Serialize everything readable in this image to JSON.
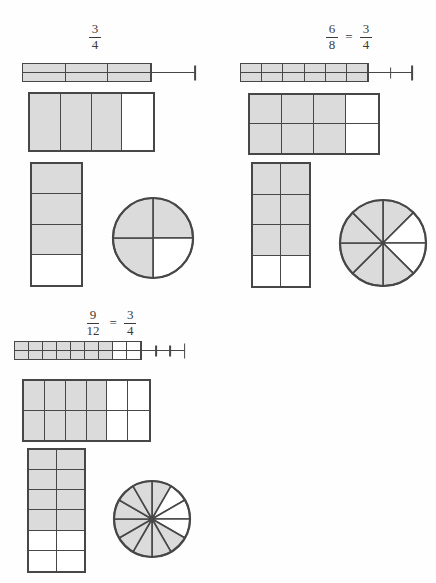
{
  "colors": {
    "shade": "#dbdbdb",
    "line": "#474747",
    "text": "#3a3a3a",
    "background": "#fefefe"
  },
  "chart_data": [
    {
      "type": "area",
      "title": "3/4",
      "representations": [
        "number-line bar",
        "horizontal grid",
        "vertical grid",
        "circle"
      ],
      "fraction_value": 0.75
    },
    {
      "type": "area",
      "title": "6/8 = 3/4",
      "representations": [
        "number-line bar",
        "horizontal grid",
        "vertical grid",
        "circle"
      ],
      "fraction_value": 0.75
    },
    {
      "type": "area",
      "title": "9/12 = 3/4",
      "representations": [
        "number-line bar",
        "horizontal grid",
        "vertical grid",
        "circle"
      ],
      "fraction_value": 0.75
    }
  ],
  "groups": [
    {
      "id": "three-fourths",
      "label": {
        "separator": "=",
        "fractions": [
          {
            "numerator": "3",
            "denominator": "4"
          }
        ]
      },
      "number_line": {
        "total_parts": 4,
        "boxed_parts": 3,
        "shaded_parts": 3,
        "tick_intervals": 1
      },
      "horizontal_grid": {
        "cols": 4,
        "rows": 1,
        "shaded_cols": 3,
        "shaded_cells": 3,
        "total_cells": 4
      },
      "vertical_grid": {
        "cols": 1,
        "rows": 4,
        "shaded_rows": 3,
        "shaded_cells": 3,
        "total_cells": 4
      },
      "circle": {
        "sectors": 4,
        "shaded_sectors": 3,
        "white_sector_indices": [
          1
        ]
      }
    },
    {
      "id": "six-eighths",
      "label": {
        "separator": "=",
        "fractions": [
          {
            "numerator": "6",
            "denominator": "8"
          },
          {
            "numerator": "3",
            "denominator": "4"
          }
        ]
      },
      "number_line": {
        "total_parts": 8,
        "boxed_parts": 6,
        "shaded_parts": 6,
        "tick_intervals": 2
      },
      "horizontal_grid": {
        "cols": 4,
        "rows": 2,
        "shaded_cols": 3,
        "shaded_cells": 6,
        "total_cells": 8
      },
      "vertical_grid": {
        "cols": 2,
        "rows": 4,
        "shaded_rows": 3,
        "shaded_cells": 6,
        "total_cells": 8
      },
      "circle": {
        "sectors": 8,
        "shaded_sectors": 6,
        "white_sector_indices": [
          1,
          2
        ]
      }
    },
    {
      "id": "nine-twelfths",
      "label": {
        "separator": "=",
        "fractions": [
          {
            "numerator": "9",
            "denominator": "12"
          },
          {
            "numerator": "3",
            "denominator": "4"
          }
        ]
      },
      "number_line": {
        "total_parts": 12,
        "boxed_parts": 9,
        "shaded_parts": 7,
        "tick_intervals": 3
      },
      "horizontal_grid": {
        "cols": 6,
        "rows": 2,
        "shaded_cols": 4,
        "shaded_cells": 8,
        "total_cells": 12
      },
      "vertical_grid": {
        "cols": 2,
        "rows": 6,
        "shaded_rows": 4,
        "shaded_cells": 8,
        "total_cells": 12
      },
      "circle": {
        "sectors": 12,
        "shaded_sectors": 9,
        "white_sector_indices": [
          1,
          2,
          3
        ]
      }
    }
  ]
}
